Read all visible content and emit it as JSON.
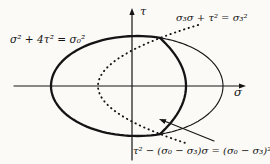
{
  "figure": {
    "colors": {
      "background": "#fbfaf7",
      "ink": "#141414"
    },
    "axes": {
      "sigma": {
        "label": "σ"
      },
      "tau": {
        "label": "τ"
      }
    },
    "equations": {
      "ellipse": "σ² + 4τ² = σ₀²",
      "tension_parabola": "σ₃σ + τ² = σ₃²",
      "compression_parabola": "τ² − (σ₀ − σ₃)σ = (σ₀ − σ₃)²"
    },
    "geometry": {
      "sigma_axis": {
        "y": 86,
        "x1": 14,
        "x2": 246
      },
      "tau_axis": {
        "x": 132,
        "y1": 160,
        "y2": 8
      },
      "ellipse": {
        "cx": 137,
        "cy": 86,
        "rx": 86,
        "ry": 50,
        "corner_x": 160
      },
      "tension_parabola": {
        "vertex_x": 186,
        "corner_x": 160,
        "corner_tau": 48
      },
      "compression_parabola": {
        "vertex_x": 98,
        "corner_x": 160,
        "corner_tau": 48,
        "tau_top": 61,
        "tau_bottom": -57
      },
      "leader_arrow": {
        "x1": 214,
        "y1": 141,
        "x2": 159,
        "y2": 119
      },
      "labels": {
        "ellipse_eq": {
          "x": 10,
          "y": 43
        },
        "tension_eq": {
          "x": 176,
          "y": 20.5
        },
        "compression_eq": {
          "x": 133,
          "y": 154
        },
        "tau": {
          "x": 140,
          "y": 15
        },
        "sigma": {
          "x": 234,
          "y": 96
        }
      }
    }
  }
}
